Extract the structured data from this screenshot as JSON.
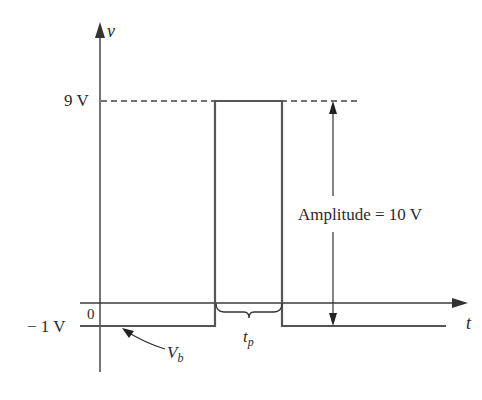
{
  "diagram": {
    "axes": {
      "y_label": "v",
      "x_label": "t",
      "origin_label": "0"
    },
    "levels": {
      "high_label": "9 V",
      "low_label": "− 1 V",
      "high_value": 9,
      "low_value": -1
    },
    "annotations": {
      "amplitude": "Amplitude  =  10 V",
      "baseline_var": "V",
      "baseline_sub": "b",
      "pulse_width_var": "t",
      "pulse_width_sub": "p"
    },
    "colors": {
      "line": "#3a3a3a",
      "text": "#2a2a2a",
      "background": "#ffffff"
    }
  }
}
